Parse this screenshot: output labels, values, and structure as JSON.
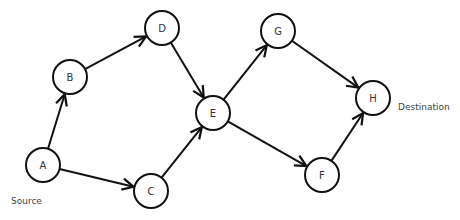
{
  "diagram": {
    "type": "directed-graph",
    "nodes": [
      {
        "id": "A",
        "label": "A",
        "x": 43,
        "y": 165
      },
      {
        "id": "B",
        "label": "B",
        "x": 70,
        "y": 77
      },
      {
        "id": "C",
        "label": "C",
        "x": 151,
        "y": 191
      },
      {
        "id": "D",
        "label": "D",
        "x": 162,
        "y": 28
      },
      {
        "id": "E",
        "label": "E",
        "x": 213,
        "y": 113
      },
      {
        "id": "F",
        "label": "F",
        "x": 322,
        "y": 175
      },
      {
        "id": "G",
        "label": "G",
        "x": 278,
        "y": 31
      },
      {
        "id": "H",
        "label": "H",
        "x": 373,
        "y": 98
      }
    ],
    "edges": [
      {
        "from": "A",
        "to": "B"
      },
      {
        "from": "A",
        "to": "C"
      },
      {
        "from": "B",
        "to": "D"
      },
      {
        "from": "D",
        "to": "E"
      },
      {
        "from": "C",
        "to": "E"
      },
      {
        "from": "E",
        "to": "G"
      },
      {
        "from": "E",
        "to": "F"
      },
      {
        "from": "G",
        "to": "H"
      },
      {
        "from": "F",
        "to": "H"
      }
    ],
    "annotations": {
      "source": "Source",
      "destination": "Destination"
    }
  }
}
